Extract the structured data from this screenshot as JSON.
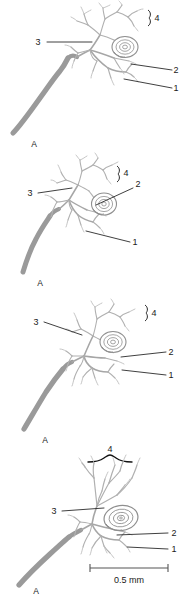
{
  "figure": {
    "panel_count": 4,
    "colors": {
      "axon": "#9a9a9a",
      "branch": "#a8a8a8",
      "fine_branch": "#b4b4b4",
      "corpuscle": "#8f8f8f",
      "leader_line": "#2a2a2a",
      "label_text": "#1a1a1a",
      "background": "#ffffff"
    },
    "panels": [
      {
        "id": "panel-1",
        "axon_label": "A",
        "labels": [
          {
            "key": "3",
            "text": "3",
            "side": "left"
          },
          {
            "key": "2",
            "text": "2",
            "side": "right"
          },
          {
            "key": "1",
            "text": "1",
            "side": "right"
          },
          {
            "key": "4",
            "text": "4",
            "side": "right",
            "marker": "bracket"
          }
        ]
      },
      {
        "id": "panel-2",
        "axon_label": "A",
        "labels": [
          {
            "key": "3",
            "text": "3",
            "side": "left"
          },
          {
            "key": "2",
            "text": "2",
            "side": "right"
          },
          {
            "key": "1",
            "text": "1",
            "side": "right"
          },
          {
            "key": "4",
            "text": "4",
            "side": "right",
            "marker": "bracket"
          }
        ]
      },
      {
        "id": "panel-3",
        "axon_label": "A",
        "labels": [
          {
            "key": "3",
            "text": "3",
            "side": "left"
          },
          {
            "key": "2",
            "text": "2",
            "side": "right"
          },
          {
            "key": "1",
            "text": "1",
            "side": "right"
          },
          {
            "key": "4",
            "text": "4",
            "side": "right",
            "marker": "bracket"
          }
        ]
      },
      {
        "id": "panel-4",
        "axon_label": "A",
        "labels": [
          {
            "key": "3",
            "text": "3",
            "side": "left"
          },
          {
            "key": "2",
            "text": "2",
            "side": "right"
          },
          {
            "key": "1",
            "text": "1",
            "side": "right"
          },
          {
            "key": "4",
            "text": "4",
            "side": "top",
            "marker": "curly-brace"
          }
        ]
      }
    ],
    "scalebar": {
      "label": "0.5 mm"
    }
  }
}
